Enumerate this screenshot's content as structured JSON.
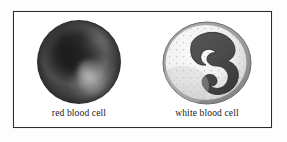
{
  "figure": {
    "background_color": "#ffffff",
    "frame_color": "#2b2b2b",
    "label_color": "#17171c"
  },
  "cells": [
    {
      "id": "red-blood-cell",
      "label": "red blood cell",
      "icon": "red-blood-cell-icon",
      "description": "dark shaded biconcave disc sphere with light highlight",
      "colors": {
        "body_dark": "#1c1c1c",
        "body_mid": "#3f3f3f",
        "body_light": "#4e4e4e",
        "highlight": "#ececec"
      }
    },
    {
      "id": "white-blood-cell",
      "label": "white blood cell",
      "icon": "white-blood-cell-icon",
      "description": "pale granular cytoplasm with dark multi-lobed trefoil nucleus and gray membrane rim",
      "colors": {
        "membrane": "#8f8f8f",
        "cytoplasm_light": "#fafafa",
        "cytoplasm_shade": "#cfcfcf",
        "granule": "#b9b9b9",
        "nucleus": "#4a4a4a",
        "nucleus_edge": "#2f2f2f"
      }
    }
  ]
}
